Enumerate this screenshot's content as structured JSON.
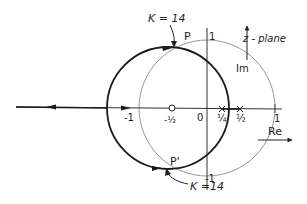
{
  "diagram": {
    "type": "root-locus",
    "plane_label": "z - plane",
    "axes": {
      "real_label": "Re",
      "imag_label": "Im",
      "ticks": {
        "real": [
          "-1",
          "0",
          "1/4",
          "1/2",
          "1"
        ],
        "imag": [
          "1",
          "-1"
        ]
      }
    },
    "zeros": [
      {
        "label": "-1/2",
        "value": -0.5
      }
    ],
    "poles": [
      {
        "label": "1/4",
        "value": 0.25
      },
      {
        "label": "1/2",
        "value": 0.5
      }
    ],
    "points": [
      {
        "name": "P",
        "label": "P"
      },
      {
        "name": "P-prime",
        "label": "P'"
      }
    ],
    "annotations": {
      "top_gain": "K = 14",
      "bottom_gain": "K =14"
    },
    "curves": {
      "unit_circle": "unit circle |z| = 1",
      "locus_circle": "root locus circle centred at -1/2"
    },
    "colors": {
      "locus": "#1a1a1a",
      "unit_circle": "#8a8a8a",
      "axes": "#333333"
    }
  },
  "labels": {
    "minus_one": "-1",
    "zero": "0",
    "quarter": "¼",
    "half": "½",
    "one_re": "1",
    "one_im": "1",
    "minus_one_im": "-1",
    "minus_half": "-½",
    "p": "P",
    "p_prime": "P'",
    "k_top": "K = 14",
    "k_bottom": "K =14",
    "z_plane": "z - plane",
    "im": "Im",
    "re": "Re"
  }
}
